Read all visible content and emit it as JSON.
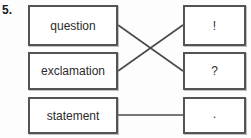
{
  "worksheet": {
    "question_number": "5.",
    "left_column": [
      {
        "id": "question",
        "label": "question"
      },
      {
        "id": "exclamation",
        "label": "exclamation"
      },
      {
        "id": "statement",
        "label": "statement"
      }
    ],
    "right_column": [
      {
        "id": "bang",
        "label": "!"
      },
      {
        "id": "qmark",
        "label": "?"
      },
      {
        "id": "period",
        "label": "."
      }
    ],
    "connections": [
      {
        "from": "question",
        "to": "qmark",
        "style": "diagonal-down"
      },
      {
        "from": "exclamation",
        "to": "bang",
        "style": "diagonal-up"
      },
      {
        "from": "statement",
        "to": "period",
        "style": "horizontal"
      }
    ],
    "colors": {
      "box_border": "#545454",
      "line": "#4a4a4a",
      "text": "#2b2b2b",
      "background": "#fdfdfd"
    }
  }
}
